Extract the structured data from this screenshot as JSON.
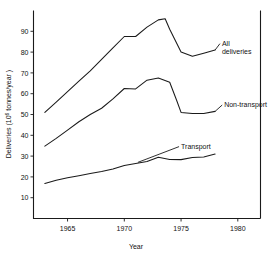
{
  "chart_data": {
    "type": "line",
    "title": "",
    "xlabel": "Year",
    "ylabel": "Deliveries (10⁶ tonnes/year)",
    "ylabel_parts": {
      "prefix": "Deliveries (10",
      "exponent": "6",
      "suffix": " tonnes/year )"
    },
    "xlim": [
      1962.0,
      1982.0
    ],
    "ylim": [
      0,
      100
    ],
    "grid": false,
    "legend_position": "inline-right-labels",
    "x_ticks": [
      1965,
      1970,
      1975,
      1980
    ],
    "x_tick_labels": [
      "1965",
      "1970",
      "1975",
      "1980"
    ],
    "y_ticks": [
      10,
      20,
      30,
      40,
      50,
      60,
      70,
      80,
      90
    ],
    "y_tick_labels": [
      "10",
      "20",
      "30",
      "40",
      "50",
      "60",
      "70",
      "80",
      "90"
    ],
    "series": [
      {
        "name": "All deliveries",
        "label_lines": [
          "All",
          "deliveries"
        ],
        "x": [
          1963.0,
          1964.0,
          1965.0,
          1966.0,
          1967.0,
          1968.0,
          1969.0,
          1970.0,
          1971.0,
          1972.0,
          1973.0,
          1973.6,
          1974.0,
          1975.0,
          1976.0,
          1977.0,
          1978.0
        ],
        "values": [
          51.0,
          56.0,
          61.0,
          66.0,
          71.0,
          76.5,
          82.0,
          87.5,
          87.5,
          92.0,
          95.5,
          96.0,
          91.0,
          80.0,
          78.0,
          79.5,
          81.0
        ]
      },
      {
        "name": "Non-transport",
        "label_lines": [
          "Non-transport"
        ],
        "x": [
          1963.0,
          1964.0,
          1965.0,
          1966.0,
          1967.0,
          1968.0,
          1969.0,
          1970.0,
          1971.0,
          1972.0,
          1973.0,
          1974.0,
          1974.6,
          1975.0,
          1976.0,
          1977.0,
          1978.0
        ],
        "values": [
          34.8,
          38.5,
          42.5,
          46.5,
          50.0,
          53.0,
          57.5,
          62.5,
          62.3,
          66.5,
          67.5,
          65.5,
          57.0,
          51.0,
          50.5,
          50.5,
          51.5
        ]
      },
      {
        "name": "Transport",
        "label_lines": [
          "Transport"
        ],
        "x": [
          1963.0,
          1964.0,
          1965.0,
          1966.0,
          1967.0,
          1968.0,
          1969.0,
          1970.0,
          1971.0,
          1972.0,
          1973.0,
          1974.0,
          1975.0,
          1976.0,
          1977.0,
          1978.0
        ],
        "values": [
          16.8,
          18.4,
          19.6,
          20.6,
          21.6,
          22.6,
          23.8,
          25.5,
          26.4,
          27.4,
          29.4,
          28.4,
          28.3,
          29.3,
          29.6,
          31.0
        ]
      }
    ],
    "annotations": [
      {
        "text": "All deliveries",
        "x": 1978.6,
        "y": 83.0
      },
      {
        "text": "Non-transport",
        "x": 1978.8,
        "y": 53.5
      },
      {
        "text": "Transport",
        "x": 1975.0,
        "y": 33.5
      }
    ],
    "colors": {
      "line": "#1a1a1a",
      "background": "#ffffff",
      "text": "#111111"
    }
  }
}
